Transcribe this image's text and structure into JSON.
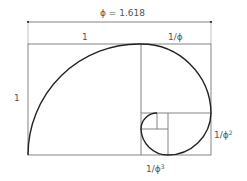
{
  "diagram": {
    "labels": {
      "total_width": "ϕ = 1.618",
      "left_width": "1",
      "right_width": "1/ϕ",
      "height": "1",
      "right_lower": "1/ϕ",
      "right_lower_exp": "2",
      "bottom_inner": "1/ϕ",
      "bottom_inner_exp": "3"
    },
    "colors": {
      "line": "#555555",
      "spiral": "#222222",
      "text": "#555555"
    }
  }
}
